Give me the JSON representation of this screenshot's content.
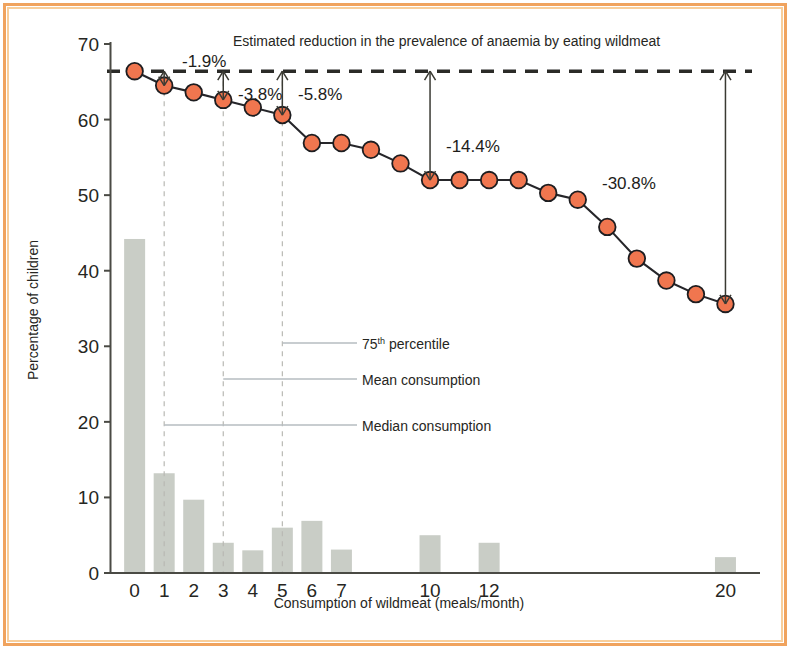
{
  "chart_data": {
    "type": "bar",
    "title": "Estimated reduction in the prevalence of anaemia by eating wildmeat",
    "xlabel": "Consumption of wildmeat (meals/month)",
    "ylabel": "Percentage of children",
    "xlim": [
      -0.8,
      21.0
    ],
    "ylim": [
      0,
      70
    ],
    "x_tick_labels": [
      "0",
      "1",
      "2",
      "3",
      "4",
      "5",
      "6",
      "7",
      "10",
      "12",
      "20"
    ],
    "x_tick_values": [
      0,
      1,
      2,
      3,
      4,
      5,
      6,
      7,
      10,
      12,
      20
    ],
    "y_tick_labels": [
      "0",
      "10",
      "20",
      "30",
      "40",
      "50",
      "60",
      "70"
    ],
    "y_tick_values": [
      0,
      10,
      20,
      30,
      40,
      50,
      60,
      70
    ],
    "grid": false,
    "legend_position": "inside-center",
    "series": [
      {
        "name": "Distribution of children",
        "type": "bar",
        "color": "#c9cdc6",
        "x": [
          0,
          1,
          2,
          3,
          4,
          5,
          6,
          7,
          10,
          12,
          20
        ],
        "values": [
          44.2,
          13.2,
          9.7,
          4.0,
          3.0,
          6.0,
          6.9,
          3.1,
          5.0,
          4.0,
          2.1
        ]
      },
      {
        "name": "Predicted prevalence of anaemia",
        "type": "line",
        "color": "#F0764F",
        "x": [
          0,
          1,
          2,
          3,
          4,
          5,
          6,
          7,
          8,
          9,
          10,
          11,
          12,
          13,
          14,
          15,
          16,
          17,
          18,
          19,
          20
        ],
        "values": [
          66.4,
          64.5,
          63.6,
          62.6,
          61.6,
          60.6,
          56.9,
          56.9,
          56.0,
          54.2,
          52.0,
          52.0,
          52.0,
          52.0,
          50.3,
          49.4,
          45.8,
          41.6,
          38.7,
          36.9,
          35.6
        ]
      }
    ],
    "reference_line": {
      "label": "baseline prevalence",
      "value": 66.4,
      "style": "dashed",
      "color": "#2b2b28"
    },
    "vertical_guides": [
      {
        "x": 1,
        "label": "Median consumption"
      },
      {
        "x": 3,
        "label": "Mean consumption"
      },
      {
        "x": 5,
        "label": "75th percentile"
      }
    ],
    "annotations": [
      {
        "label": "-1.9%",
        "x": 1,
        "from": 66.4,
        "to": 64.5
      },
      {
        "label": "-3.8%",
        "x": 3,
        "from": 66.4,
        "to": 62.6
      },
      {
        "label": "-5.8%",
        "x": 5,
        "from": 66.4,
        "to": 60.6
      },
      {
        "label": "-14.4%",
        "x": 10,
        "from": 66.4,
        "to": 52.0
      },
      {
        "label": "-30.8%",
        "x": 20,
        "from": 66.4,
        "to": 35.6
      }
    ],
    "legend_entries": [
      {
        "label_main": "75",
        "label_sup": "th",
        "label_rest": " percentile",
        "guide_x": 5
      },
      {
        "label_main": "Mean consumption",
        "label_sup": "",
        "label_rest": "",
        "guide_x": 3
      },
      {
        "label_main": "Median consumption",
        "label_sup": "",
        "label_rest": "",
        "guide_x": 1
      }
    ]
  },
  "figure": {
    "frame_color": "#F0A35E",
    "frame_inner_color": "#F8CE9B",
    "background": "#ffffff"
  }
}
